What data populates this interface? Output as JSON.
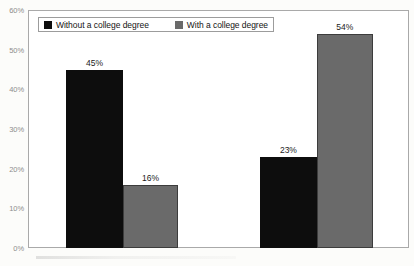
{
  "legend": {
    "items": [
      {
        "label": "Without a college degree",
        "swatch": "dark",
        "color": "#0d0d0d"
      },
      {
        "label": "With a college degree",
        "swatch": "light",
        "color": "#6a6a6a"
      }
    ]
  },
  "y_axis": {
    "ticks": [
      "60%",
      "50%",
      "40%",
      "30%",
      "20%",
      "10%",
      "0%"
    ],
    "values": [
      60,
      50,
      40,
      30,
      20,
      10,
      0
    ]
  },
  "bars": [
    {
      "name": "group1-without-degree",
      "label": "45%",
      "value": 45,
      "series": "Without a college degree",
      "style": "dark",
      "left_pct": 10.0,
      "width_pct": 14.9
    },
    {
      "name": "group1-with-degree",
      "label": "16%",
      "value": 16,
      "series": "With a college degree",
      "style": "light",
      "left_pct": 24.9,
      "width_pct": 14.5
    },
    {
      "name": "group2-without-degree",
      "label": "23%",
      "value": 23,
      "series": "Without a college degree",
      "style": "dark",
      "left_pct": 60.9,
      "width_pct": 14.9
    },
    {
      "name": "group2-with-degree",
      "label": "54%",
      "value": 54,
      "series": "With a college degree",
      "style": "light",
      "left_pct": 75.8,
      "width_pct": 14.7
    }
  ],
  "chart_data": {
    "type": "bar",
    "title": "",
    "subtitle": "",
    "xlabel": "",
    "ylabel": "",
    "categories": [
      "Group 1",
      "Group 2"
    ],
    "series": [
      {
        "name": "Without a college degree",
        "values": [
          45,
          23
        ],
        "color": "#0d0d0d"
      },
      {
        "name": "With a college degree",
        "values": [
          16,
          54
        ],
        "color": "#6a6a6a"
      }
    ],
    "value_labels": [
      "45%",
      "16%",
      "23%",
      "54%"
    ],
    "ylim": [
      0,
      60
    ],
    "ytick_step": 10,
    "ytick_labels": [
      "0%",
      "10%",
      "20%",
      "30%",
      "40%",
      "50%",
      "60%"
    ],
    "grid": false,
    "legend_position": "top-left-inside",
    "legend_boxed": true,
    "plot_border": true,
    "xtick_labels": []
  },
  "colors": {
    "bar_dark": "#0d0d0d",
    "bar_light": "#6a6a6a",
    "axis_text": "#8d8d8d",
    "plot_border": "#a9a9a9",
    "label_text": "#1b1b1b",
    "background": "#fcfcfa"
  }
}
